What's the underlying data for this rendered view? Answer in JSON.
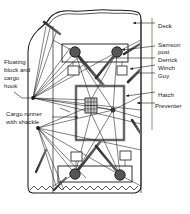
{
  "figure": {
    "type": "technical-diagram",
    "view": "plan view of deck with two derricks",
    "background_color": "#ffffff",
    "line_color": "#1a1a1a",
    "fill_dark": "#4d4d4d",
    "fill_light": "#bfbfbf"
  },
  "labels": {
    "right": [
      {
        "id": "deck",
        "text": "Deck",
        "x": 158,
        "y": 25,
        "arrow_to": [
          133,
          28
        ]
      },
      {
        "id": "samson_post",
        "text": "Samson",
        "x": 158,
        "y": 44,
        "arrow_to": [
          120,
          49
        ]
      },
      {
        "id": "samson_post2",
        "text": "post",
        "x": 158,
        "y": 51,
        "arrow_to": null
      },
      {
        "id": "derrick",
        "text": "Derrick",
        "x": 158,
        "y": 59,
        "arrow_to": [
          112,
          56
        ]
      },
      {
        "id": "winch",
        "text": "Winch",
        "x": 158,
        "y": 67,
        "arrow_to": [
          119,
          67
        ]
      },
      {
        "id": "guy",
        "text": "Guy",
        "x": 158,
        "y": 75,
        "arrow_to": [
          131,
          74
        ]
      },
      {
        "id": "hatch",
        "text": "Hatch",
        "x": 158,
        "y": 94,
        "arrow_to": [
          120,
          92
        ]
      },
      {
        "id": "preventer",
        "text": "Preventer",
        "x": 158,
        "y": 105,
        "arrow_to": [
          134,
          104
        ]
      }
    ],
    "left": [
      {
        "id": "floating_block",
        "lines": [
          "Floating",
          "block and",
          "cargo",
          "hook"
        ],
        "x": 4,
        "y": 61,
        "arrow_to": [
          33,
          98
        ]
      },
      {
        "id": "cargo_runner",
        "lines": [
          "Cargo runner",
          "with shackle"
        ],
        "x": 6,
        "y": 112,
        "arrow_to": [
          38,
          128
        ]
      }
    ]
  },
  "components": {
    "hull": {
      "name": "ship-hull-outline",
      "note": "irregular wavy closed outline"
    },
    "waterline": {
      "name": "waterline-zigzag"
    },
    "deck_rect_top": {
      "name": "samson-post-platform-top",
      "x": 62,
      "y": 44,
      "w": 66,
      "h": 18
    },
    "deck_rect_bottom": {
      "name": "samson-post-platform-bottom",
      "x": 58,
      "y": 166,
      "w": 74,
      "h": 16
    },
    "hatch": {
      "name": "cargo-hatch",
      "x": 76,
      "y": 86,
      "w": 48,
      "h": 54
    },
    "masthead_blocks": [
      {
        "name": "masthead-block-top-left",
        "cx": 75,
        "cy": 52,
        "r": 5.2
      },
      {
        "name": "masthead-block-top-right",
        "cx": 117,
        "cy": 52,
        "r": 5.2
      },
      {
        "name": "masthead-block-bot-left",
        "cx": 75,
        "cy": 174,
        "r": 5.2
      },
      {
        "name": "masthead-block-bot-right",
        "cx": 120,
        "cy": 175,
        "r": 5.2
      }
    ],
    "winches": [
      {
        "name": "winch-top-left",
        "x": 68,
        "y": 66,
        "w": 11,
        "h": 9
      },
      {
        "name": "winch-top-right",
        "x": 117,
        "y": 66,
        "w": 10,
        "h": 9
      },
      {
        "name": "winch-bot-left",
        "x": 71,
        "y": 152,
        "w": 11,
        "h": 9
      },
      {
        "name": "winch-bot-right",
        "x": 120,
        "y": 151,
        "w": 11,
        "h": 9
      }
    ],
    "cargo_block": {
      "name": "floating-block-cargo-hook",
      "x": 85,
      "y": 98,
      "w": 12,
      "h": 15
    },
    "runner_node": {
      "name": "cargo-runner-shackle-node",
      "cx": 113,
      "cy": 110,
      "r": 2.2
    },
    "guy_fan_upper": {
      "name": "guy-convergence-upper",
      "cx": 33,
      "cy": 98
    },
    "guy_fan_lower": {
      "name": "guy-convergence-lower",
      "cx": 38,
      "cy": 128
    }
  }
}
